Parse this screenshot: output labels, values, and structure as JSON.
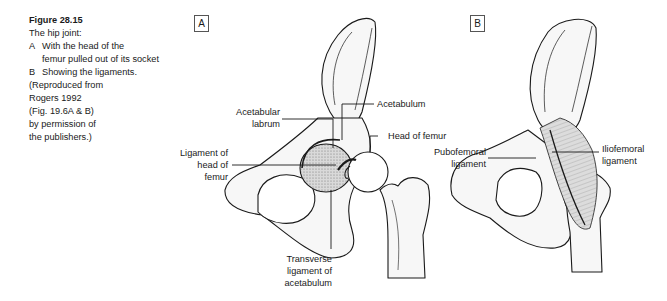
{
  "caption": {
    "figure_number": "Figure 28.15",
    "title": "The hip joint:",
    "items": [
      {
        "tag": "A",
        "text": "With the head of the",
        "continuation": "femur pulled out of its socket"
      },
      {
        "tag": "B",
        "text": "Showing the ligaments."
      }
    ],
    "credit_lines": [
      "(Reproduced from",
      "Rogers 1992",
      "(Fig. 19.6A & B)",
      "by permission of",
      "the publishers.)"
    ]
  },
  "panels": {
    "a": {
      "tag": "A",
      "labels": {
        "acetabular_labrum": [
          "Acetabular",
          "labrum"
        ],
        "acetabulum": [
          "Acetabulum"
        ],
        "head_of_femur": [
          "Head of femur"
        ],
        "ligament_of_head": [
          "Ligament of",
          "head of",
          "femur"
        ],
        "transverse_ligament": [
          "Transverse",
          "ligament of",
          "acetabulum"
        ]
      }
    },
    "b": {
      "tag": "B",
      "labels": {
        "pubofemoral": [
          "Pubofemoral",
          "ligament"
        ],
        "iliofemoral": [
          "Iliofemoral",
          "ligament"
        ]
      }
    }
  },
  "colors": {
    "ink": "#1a1a1a",
    "bone_fill": "#f6f6f6",
    "shade": "#c8c8c8"
  }
}
